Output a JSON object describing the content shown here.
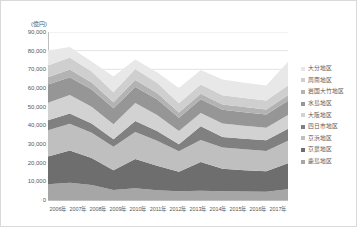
{
  "chart_data": {
    "type": "area",
    "stacked": true,
    "title": "",
    "subtitle": "",
    "xlabel": "",
    "ylabel": "(億円)",
    "unit_label": "(億円)",
    "grid": true,
    "legend_position": "right",
    "ylim": [
      0,
      90000
    ],
    "ytick_step": 10000,
    "categories": [
      "2006年",
      "2007年",
      "2008年",
      "2009年",
      "2010年",
      "2011年",
      "2012年",
      "2013年",
      "2014年",
      "2015年",
      "2016年",
      "2017年"
    ],
    "ytick_labels": [
      "90,000",
      "80,000",
      "70,000",
      "60,000",
      "50,000",
      "40,000",
      "30,000",
      "20,000",
      "10,000",
      "0"
    ],
    "ytick_values": [
      90000,
      80000,
      70000,
      60000,
      50000,
      40000,
      30000,
      20000,
      10000,
      0
    ],
    "stack_order_bottom_to_top": [
      "鹿島地区",
      "京葉地区",
      "京浜地区",
      "四日市地区",
      "大阪地区",
      "水島地区",
      "岩国大竹地区",
      "周南地区",
      "大分地区"
    ],
    "series": [
      {
        "name": "鹿島地区",
        "color": "#a6a6a6",
        "values": [
          8500,
          9200,
          8100,
          5400,
          6300,
          5200,
          4700,
          5000,
          4700,
          4500,
          4400,
          5800
        ]
      },
      {
        "name": "京葉地区",
        "color": "#6e6e6e",
        "values": [
          14800,
          17300,
          14400,
          10600,
          15700,
          13100,
          10400,
          15400,
          12000,
          11500,
          11000,
          13900
        ]
      },
      {
        "name": "京浜地区",
        "color": "#bfbfbf",
        "values": [
          14100,
          14300,
          13500,
          12500,
          14400,
          13500,
          11000,
          11700,
          11400,
          11200,
          10900,
          12100
        ]
      },
      {
        "name": "四日市地区",
        "color": "#808080",
        "values": [
          5300,
          5600,
          5000,
          4100,
          5900,
          5100,
          3800,
          7400,
          5700,
          5600,
          5700,
          6400
        ]
      },
      {
        "name": "大阪地区",
        "color": "#d2d2d2",
        "values": [
          9400,
          9900,
          9000,
          8000,
          9600,
          8700,
          7000,
          7100,
          7200,
          7000,
          6700,
          7400
        ]
      },
      {
        "name": "水島地区",
        "color": "#969696",
        "values": [
          9800,
          9500,
          9200,
          8500,
          8700,
          8400,
          7200,
          7400,
          7300,
          7200,
          7100,
          7600
        ]
      },
      {
        "name": "岩国大竹地区",
        "color": "#b3b3b3",
        "values": [
          3900,
          4100,
          3700,
          3300,
          3700,
          3300,
          2800,
          2900,
          2900,
          2800,
          2700,
          2900
        ]
      },
      {
        "name": "周南地区",
        "color": "#cfcfcf",
        "values": [
          6300,
          6500,
          6000,
          5300,
          5900,
          5500,
          4900,
          5000,
          4900,
          4900,
          4800,
          5200
        ]
      },
      {
        "name": "大分地区",
        "color": "#e8e8e8",
        "values": [
          8000,
          5600,
          5300,
          8500,
          5100,
          5600,
          8200,
          7800,
          8400,
          8100,
          8000,
          12700
        ]
      }
    ],
    "totals": [
      80100,
      82000,
      74200,
      66200,
      75300,
      68400,
      60000,
      69700,
      64500,
      62800,
      61300,
      74000
    ]
  },
  "legend": {
    "items": [
      {
        "label": "大分地区"
      },
      {
        "label": "周南地区"
      },
      {
        "label": "岩国大竹地区"
      },
      {
        "label": "水島地区"
      },
      {
        "label": "大阪地区"
      },
      {
        "label": "四日市地区"
      },
      {
        "label": "京浜地区"
      },
      {
        "label": "京葉地区"
      },
      {
        "label": "鹿島地区"
      }
    ]
  }
}
